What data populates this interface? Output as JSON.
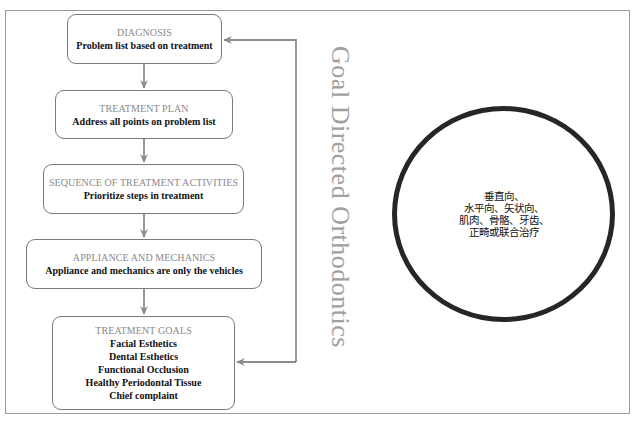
{
  "diagram": {
    "title": "Goal Directed Orthodontics",
    "colors": {
      "box_border": "#7a7a7a",
      "arrow": "#8c8c8c",
      "title_text": "#8a8a8a",
      "body_text": "#111111",
      "circle_border": "#262626"
    },
    "boxes": [
      {
        "title": "DIAGNOSIS",
        "lines": [
          "Problem list based on treatment"
        ]
      },
      {
        "title": "TREATMENT PLAN",
        "lines": [
          "Address all points on problem list"
        ]
      },
      {
        "title": "SEQUENCE OF TREATMENT ACTIVITIES",
        "lines": [
          "Prioritize steps in treatment"
        ]
      },
      {
        "title": "APPLIANCE AND MECHANICS",
        "lines": [
          "Appliance and mechanics are only the vehicles"
        ]
      },
      {
        "title": "TREATMENT GOALS",
        "lines": [
          "Facial Esthetics",
          "Dental Esthetics",
          "Functional Occlusion",
          "Healthy Periodontal Tissue",
          "Chief complaint"
        ]
      }
    ],
    "flow": [
      "DIAGNOSIS → TREATMENT PLAN",
      "TREATMENT PLAN → SEQUENCE OF TREATMENT ACTIVITIES",
      "SEQUENCE OF TREATMENT ACTIVITIES → APPLIANCE AND MECHANICS",
      "APPLIANCE AND MECHANICS → TREATMENT GOALS",
      "feedback loop: TREATMENT GOALS ↔ DIAGNOSIS"
    ],
    "circle": {
      "lines": [
        "垂直向、",
        "水平向、矢状向、",
        "肌肉、骨骼、牙齿、",
        "正畸或联合治疗"
      ]
    }
  }
}
